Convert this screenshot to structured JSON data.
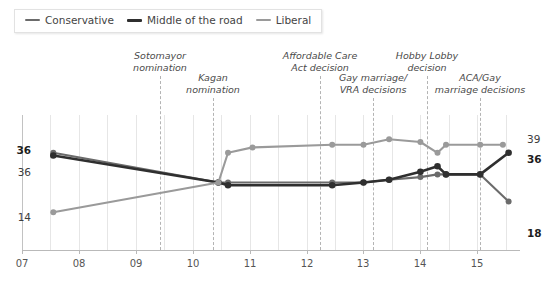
{
  "legend": {
    "items": [
      {
        "label": "Conservative",
        "color": "#6b6b6b",
        "weight": "thin"
      },
      {
        "label": "Middle of the road",
        "color": "#2f2f2f",
        "weight": "thick"
      },
      {
        "label": "Liberal",
        "color": "#9a9a9a",
        "weight": "thin"
      }
    ]
  },
  "annotations": [
    {
      "id": "sotomayor",
      "text_line1": "Sotomayor",
      "text_line2": "nomination",
      "x": 160,
      "label_y": 50,
      "line_top": 76,
      "line_bottom": 250
    },
    {
      "id": "kagan",
      "text_line1": "Kagan",
      "text_line2": "nomination",
      "x": 213,
      "label_y": 72,
      "line_top": 98,
      "line_bottom": 250
    },
    {
      "id": "aca",
      "text_line1": "Affordable Care",
      "text_line2": "Act decision",
      "x": 320,
      "label_y": 50,
      "line_top": 76,
      "line_bottom": 250
    },
    {
      "id": "gay-marriage-vra",
      "text_line1": "Gay marriage/",
      "text_line2": "VRA decisions",
      "x": 373,
      "label_y": 72,
      "line_top": 98,
      "line_bottom": 250
    },
    {
      "id": "hobby-lobby",
      "text_line1": "Hobby Lobby",
      "text_line2": "decision",
      "x": 427,
      "label_y": 50,
      "line_top": 76,
      "line_bottom": 250
    },
    {
      "id": "aca-gay-marriage",
      "text_line1": "ACA/Gay",
      "text_line2": "marriage decisions",
      "x": 480,
      "label_y": 72,
      "line_top": 98,
      "line_bottom": 250
    }
  ],
  "value_labels": [
    {
      "id": "left-conservative",
      "text": "36",
      "x": 31,
      "y": 145,
      "style": "bold"
    },
    {
      "id": "left-middle",
      "text": "36",
      "x": 31,
      "y": 167,
      "style": "plain"
    },
    {
      "id": "left-liberal",
      "text": "14",
      "x": 31,
      "y": 212,
      "style": "plain"
    },
    {
      "id": "right-liberal",
      "text": "39",
      "x": 527,
      "y": 134,
      "style": "plain"
    },
    {
      "id": "right-middle",
      "text": "36",
      "x": 527,
      "y": 154,
      "style": "bold"
    },
    {
      "id": "right-conservative",
      "text": "18",
      "x": 527,
      "y": 228,
      "style": "bold"
    }
  ],
  "chart_data": {
    "type": "line",
    "title": "",
    "subtitle": "",
    "xlabel": "",
    "ylabel": "",
    "grid": true,
    "legend_position": "top-left",
    "xlim": [
      2007.0,
      2015.75
    ],
    "ylim": [
      0,
      50
    ],
    "xticks": [
      "07",
      "08",
      "09",
      "10",
      "11",
      "12",
      "13",
      "14",
      "15"
    ],
    "xtick_values": [
      2007,
      2008,
      2009,
      2010,
      2011,
      2012,
      2013,
      2014,
      2015
    ],
    "series": [
      {
        "name": "Conservative",
        "color": "#6b6b6b",
        "start_label": "36",
        "end_label": "18",
        "x": [
          2007.55,
          2010.45,
          2010.62,
          2012.45,
          2013.0,
          2013.45,
          2014.0,
          2014.3,
          2014.45,
          2015.05,
          2015.55
        ],
        "values": [
          36,
          25,
          25,
          25,
          25,
          26,
          27,
          28,
          28,
          28,
          18
        ]
      },
      {
        "name": "Middle of the road",
        "color": "#2f2f2f",
        "start_label": "36",
        "end_label": "36",
        "x": [
          2007.55,
          2010.45,
          2010.62,
          2012.45,
          2013.0,
          2013.45,
          2014.0,
          2014.3,
          2014.45,
          2015.05,
          2015.55
        ],
        "values": [
          35,
          25,
          24,
          24,
          25,
          26,
          29,
          31,
          28,
          28,
          36
        ]
      },
      {
        "name": "Liberal",
        "color": "#9a9a9a",
        "start_label": "14",
        "end_label": "39",
        "x": [
          2007.55,
          2010.45,
          2010.62,
          2011.05,
          2012.45,
          2013.0,
          2013.45,
          2014.0,
          2014.3,
          2014.45,
          2015.05,
          2015.45
        ],
        "values": [
          14,
          25,
          36,
          38,
          39,
          39,
          41,
          40,
          36,
          39,
          39,
          39
        ]
      }
    ]
  }
}
